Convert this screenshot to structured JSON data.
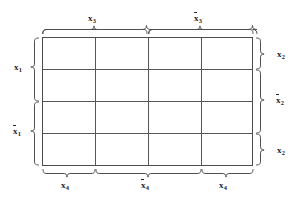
{
  "figure": {
    "type": "karnaugh-map",
    "grid": {
      "rows": 4,
      "columns": 4,
      "cells": [
        [
          "",
          "",
          "",
          ""
        ],
        [
          "",
          "",
          "",
          ""
        ],
        [
          "",
          "",
          "",
          ""
        ],
        [
          "",
          "",
          "",
          ""
        ]
      ]
    },
    "colors": {
      "line": "#55565a",
      "border": "#4b4c50",
      "brace": "#4e4f53",
      "text": "#242426",
      "background": "#ffffff"
    }
  },
  "labels": {
    "top": [
      {
        "id": "top-x3",
        "var": "x",
        "sub": "3",
        "overbar": false,
        "text": "x3",
        "span_columns": [
          1,
          2
        ]
      },
      {
        "id": "top-x3-bar",
        "var": "x",
        "sub": "3",
        "overbar": true,
        "text": "x̅3",
        "span_columns": [
          3,
          4
        ]
      }
    ],
    "bottom": [
      {
        "id": "bottom-x4-left",
        "var": "x",
        "sub": "4",
        "overbar": false,
        "text": "x4",
        "span_columns": [
          1,
          1
        ]
      },
      {
        "id": "bottom-x4-bar",
        "var": "x",
        "sub": "4",
        "overbar": true,
        "text": "x̅4",
        "span_columns": [
          2,
          3
        ]
      },
      {
        "id": "bottom-x4-right",
        "var": "x",
        "sub": "4",
        "overbar": false,
        "text": "x4",
        "span_columns": [
          4,
          4
        ]
      }
    ],
    "left": [
      {
        "id": "left-x1",
        "var": "x",
        "sub": "1",
        "overbar": false,
        "text": "x1",
        "span_rows": [
          1,
          2
        ]
      },
      {
        "id": "left-x1-bar",
        "var": "x",
        "sub": "1",
        "overbar": true,
        "text": "x̅1",
        "span_rows": [
          3,
          4
        ]
      }
    ],
    "right": [
      {
        "id": "right-x2-top",
        "var": "x",
        "sub": "2",
        "overbar": false,
        "text": "x2",
        "span_rows": [
          1,
          1
        ]
      },
      {
        "id": "right-x2-bar",
        "var": "x",
        "sub": "2",
        "overbar": true,
        "text": "x̅2",
        "span_rows": [
          2,
          3
        ]
      },
      {
        "id": "right-x2-bottom",
        "var": "x",
        "sub": "2",
        "overbar": false,
        "text": "x2",
        "span_rows": [
          4,
          4
        ]
      }
    ]
  }
}
